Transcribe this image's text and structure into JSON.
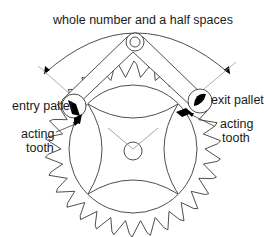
{
  "diagram": {
    "labels": {
      "span": "whole number and a half spaces",
      "entry_pallet": "entry pallet",
      "exit_pallet": "exit pallet",
      "entry_acting_1": "acting",
      "entry_acting_2": "tooth",
      "exit_acting_1": "acting",
      "exit_acting_2": "tooth"
    },
    "colors": {
      "line": "#3a3a3a",
      "guide": "#9a9a9a",
      "fill": "#000000",
      "background": "#ffffff"
    },
    "wheel": {
      "teeth": 30
    }
  }
}
